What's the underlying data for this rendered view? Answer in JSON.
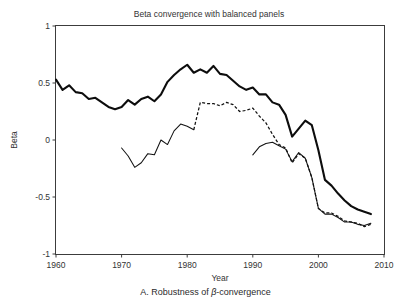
{
  "figure": {
    "title": "Beta convergence with balanced panels",
    "caption_prefix": "A. Robustness of ",
    "caption_italic": "β",
    "caption_suffix": "-convergence"
  },
  "chart_data": {
    "type": "line",
    "title": "Beta convergence with balanced panels",
    "xlabel": "Year",
    "ylabel": "Beta",
    "xlim": [
      1960,
      2010
    ],
    "ylim": [
      -1,
      1
    ],
    "grid": false,
    "legend": "none",
    "xticks": [
      1960,
      1970,
      1980,
      1990,
      2000,
      2010
    ],
    "xtick_labels": [
      "1960",
      "1970",
      "1980",
      "1990",
      "2000",
      "2010"
    ],
    "yticks": [
      -1,
      -0.5,
      0,
      0.5,
      1
    ],
    "ytick_labels": [
      "-1",
      "-0.5",
      "0",
      "0.5",
      "1"
    ],
    "series": [
      {
        "name": "full-sample-beta",
        "style": "solid-thick",
        "x": [
          1960,
          1961,
          1962,
          1963,
          1964,
          1965,
          1966,
          1967,
          1968,
          1969,
          1970,
          1971,
          1972,
          1973,
          1974,
          1975,
          1976,
          1977,
          1978,
          1979,
          1980,
          1981,
          1982,
          1983,
          1984,
          1985,
          1986,
          1987,
          1988,
          1989,
          1990,
          1991,
          1992,
          1993,
          1994,
          1995,
          1996,
          1997,
          1998,
          1999,
          2000,
          2001,
          2002,
          2003,
          2004,
          2005,
          2006,
          2007,
          2008
        ],
        "values": [
          0.53,
          0.44,
          0.48,
          0.42,
          0.41,
          0.36,
          0.37,
          0.33,
          0.29,
          0.27,
          0.29,
          0.35,
          0.31,
          0.36,
          0.38,
          0.34,
          0.4,
          0.51,
          0.57,
          0.62,
          0.66,
          0.59,
          0.62,
          0.59,
          0.65,
          0.58,
          0.57,
          0.52,
          0.47,
          0.44,
          0.46,
          0.4,
          0.4,
          0.33,
          0.31,
          0.22,
          0.03,
          0.1,
          0.17,
          0.13,
          -0.09,
          -0.35,
          -0.4,
          -0.47,
          -0.53,
          -0.58,
          -0.61,
          -0.63,
          -0.65
        ]
      },
      {
        "name": "restricted-panel-beta",
        "style": "mixed-solid-dashed",
        "solid_segment_end": 1981,
        "x": [
          1970,
          1971,
          1972,
          1973,
          1974,
          1975,
          1976,
          1977,
          1978,
          1979,
          1980,
          1981,
          1982,
          1983,
          1984,
          1985,
          1986,
          1987,
          1988,
          1989,
          1990,
          1991,
          1992,
          1993,
          1994,
          1995,
          1996,
          1997,
          1998,
          1999,
          2000,
          2001,
          2002,
          2003,
          2004,
          2005,
          2006,
          2007,
          2008
        ],
        "values": [
          -0.07,
          -0.14,
          -0.24,
          -0.2,
          -0.12,
          -0.13,
          0.0,
          -0.04,
          0.08,
          0.14,
          0.12,
          0.09,
          0.33,
          0.32,
          0.32,
          0.3,
          0.33,
          0.31,
          0.25,
          0.26,
          0.28,
          0.21,
          0.15,
          0.05,
          -0.04,
          -0.07,
          -0.2,
          -0.12,
          -0.16,
          -0.33,
          -0.6,
          -0.64,
          -0.64,
          -0.67,
          -0.71,
          -0.72,
          -0.73,
          -0.76,
          -0.74
        ]
      },
      {
        "name": "late-sample-beta",
        "style": "solid-thin",
        "x": [
          1990,
          1991,
          1992,
          1993,
          1994,
          1995,
          1996,
          1997,
          1998,
          1999,
          2000,
          2001,
          2002,
          2003,
          2004,
          2005,
          2006,
          2007,
          2008
        ],
        "values": [
          -0.13,
          -0.06,
          -0.03,
          -0.02,
          -0.05,
          -0.08,
          -0.19,
          -0.11,
          -0.16,
          -0.33,
          -0.6,
          -0.65,
          -0.65,
          -0.68,
          -0.72,
          -0.72,
          -0.74,
          -0.75,
          -0.73
        ]
      }
    ]
  }
}
